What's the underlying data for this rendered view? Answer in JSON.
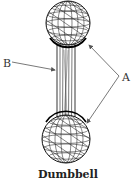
{
  "diagram": {
    "caption": "Dumbbell",
    "labels": [
      {
        "id": "A",
        "text": "A",
        "points_to": [
          "top-sphere",
          "bottom-sphere"
        ]
      },
      {
        "id": "B",
        "text": "B",
        "points_to": [
          "handle"
        ]
      }
    ],
    "parts": [
      {
        "id": "top-sphere",
        "shape": "wireframe-sphere"
      },
      {
        "id": "handle",
        "shape": "wireframe-cylinder"
      },
      {
        "id": "bottom-sphere",
        "shape": "wireframe-sphere"
      }
    ],
    "colors": {
      "line": "#222222",
      "arrow": "#666666",
      "background": "#ffffff"
    }
  }
}
